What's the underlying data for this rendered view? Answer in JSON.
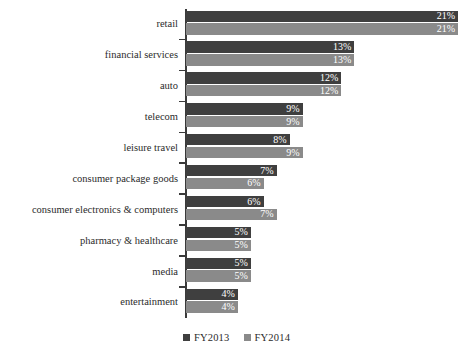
{
  "chart_data": {
    "type": "bar",
    "orientation": "horizontal",
    "title": "",
    "subtitle": "",
    "xlabel": "",
    "ylabel": "",
    "grid": false,
    "legend_position": "bottom-center",
    "xlim": [
      0,
      21
    ],
    "value_suffix": "%",
    "categories": [
      "retail",
      "financial services",
      "auto",
      "telecom",
      "leisure travel",
      "consumer package goods",
      "consumer electronics & computers",
      "pharmacy & healthcare",
      "media",
      "entertainment"
    ],
    "series": [
      {
        "name": "FY2013",
        "color": "#3f3f3f",
        "values": [
          21,
          13,
          12,
          9,
          8,
          7,
          6,
          5,
          5,
          4
        ],
        "labels": [
          "21%",
          "13%",
          "12%",
          "9%",
          "8%",
          "7%",
          "6%",
          "5%",
          "5%",
          "4%"
        ]
      },
      {
        "name": "FY2014",
        "color": "#8a8a8a",
        "values": [
          21,
          13,
          12,
          9,
          9,
          6,
          7,
          5,
          5,
          4
        ],
        "labels": [
          "21%",
          "13%",
          "12%",
          "9%",
          "9%",
          "6%",
          "7%",
          "5%",
          "5%",
          "4%"
        ]
      }
    ]
  },
  "legend": {
    "items": [
      {
        "label": "FY2013",
        "color": "#3f3f3f"
      },
      {
        "label": "FY2014",
        "color": "#8a8a8a"
      }
    ]
  }
}
